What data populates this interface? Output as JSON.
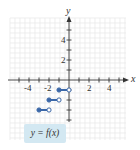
{
  "chart_data": {
    "type": "line",
    "title": "",
    "xlabel": "x",
    "ylabel": "y",
    "xlim": [
      -6,
      6
    ],
    "ylim": [
      -6,
      6
    ],
    "grid": true,
    "x_ticks": [
      -4,
      -2,
      2,
      4
    ],
    "y_ticks": [
      2,
      4
    ],
    "legend": "y = f(x)",
    "series": [
      {
        "name": "y = f(x)",
        "segments": [
          {
            "x_start": -1,
            "x_end": 0,
            "y": -1,
            "start_closed": true,
            "end_closed": false
          },
          {
            "x_start": -2,
            "x_end": -1,
            "y": -2,
            "start_closed": true,
            "end_closed": false
          },
          {
            "x_start": -3,
            "x_end": -2,
            "y": -3,
            "start_closed": true,
            "end_closed": false
          }
        ]
      }
    ],
    "colors": {
      "series": "#3a67a8",
      "grid": "#e6e6e6",
      "axis": "#333333",
      "callout_bg": "#d3e8f2"
    }
  },
  "labels": {
    "x_axis": "x",
    "y_axis": "y",
    "x_tick_labels": [
      "-4",
      "-2",
      "2",
      "4"
    ],
    "y_tick_labels": [
      "4",
      "2"
    ],
    "callout": "y = f(x)"
  }
}
